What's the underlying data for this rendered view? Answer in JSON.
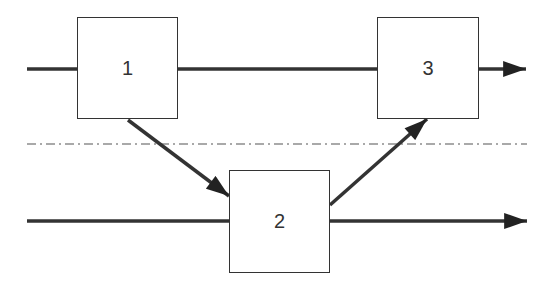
{
  "diagram": {
    "type": "process-flow",
    "nodes": [
      {
        "id": "1",
        "label": "1",
        "x": 77,
        "y": 17,
        "w": 101,
        "h": 102
      },
      {
        "id": "2",
        "label": "2",
        "x": 229,
        "y": 170,
        "w": 101,
        "h": 103
      },
      {
        "id": "3",
        "label": "3",
        "x": 377,
        "y": 17,
        "w": 102,
        "h": 102
      }
    ],
    "edges": [
      {
        "from": "input-top",
        "to": "1"
      },
      {
        "from": "1",
        "to": "3"
      },
      {
        "from": "3",
        "to": "output-top",
        "arrow": true
      },
      {
        "from": "1",
        "to": "2",
        "arrow": true
      },
      {
        "from": "2",
        "to": "3",
        "arrow": true
      },
      {
        "from": "input-bottom",
        "to": "2"
      },
      {
        "from": "2",
        "to": "output-bottom",
        "arrow": true
      }
    ],
    "separator": {
      "style": "dash-dot",
      "y": 144
    }
  }
}
